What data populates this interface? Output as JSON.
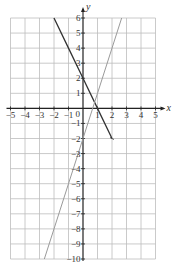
{
  "chart_data": {
    "type": "line",
    "title": "",
    "xlabel": "x",
    "ylabel": "y",
    "xlim": [
      -5,
      5
    ],
    "ylim": [
      -10,
      6
    ],
    "grid": true,
    "x_ticks": [
      -5,
      -4,
      -3,
      -2,
      -1,
      0,
      1,
      2,
      3,
      4,
      5
    ],
    "y_ticks": [
      -10,
      -9,
      -8,
      -7,
      -6,
      -5,
      -4,
      -3,
      -2,
      -1,
      1,
      2,
      3,
      4,
      5,
      6
    ],
    "origin_label": "0",
    "series": [
      {
        "name": "y = -2x + 2",
        "color": "#333333",
        "width": 1.3,
        "points": [
          [
            -2,
            6
          ],
          [
            -1,
            4
          ],
          [
            0,
            2
          ],
          [
            1,
            0
          ],
          [
            2,
            -2
          ]
        ]
      },
      {
        "name": "y = 3x - 2",
        "color": "#9a9a9a",
        "width": 1.0,
        "points": [
          [
            -2.6667,
            -10
          ],
          [
            -2,
            -8
          ],
          [
            -1,
            -5
          ],
          [
            0,
            -2
          ],
          [
            1,
            1
          ],
          [
            2,
            4
          ],
          [
            2.6667,
            6
          ]
        ]
      }
    ],
    "colors": {
      "grid": "#bdbdbd",
      "axis": "#222222",
      "tick_label": "#333333"
    }
  }
}
